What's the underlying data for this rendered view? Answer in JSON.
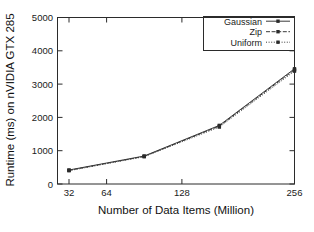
{
  "chart_data": {
    "type": "line",
    "title": "",
    "xlabel": "Number of Data Items (Million)",
    "ylabel": "Runtime (ms) on nVIDIA GTX 285",
    "x": [
      32,
      64,
      128,
      256
    ],
    "xticklabels": [
      "32",
      "64",
      "128",
      "256"
    ],
    "yticklabels": [
      "0",
      "1000",
      "2000",
      "3000",
      "4000",
      "5000"
    ],
    "yticks": [
      0,
      1000,
      2000,
      3000,
      4000,
      5000
    ],
    "ylim": [
      0,
      5000
    ],
    "xscale": "log2",
    "grid": false,
    "legend_position": "top-right",
    "series": [
      {
        "name": "Gaussian",
        "values": [
          420,
          840,
          1760,
          3460
        ],
        "style": "solid",
        "marker": "square",
        "color": "#3a3a3a"
      },
      {
        "name": "Zip",
        "values": [
          410,
          830,
          1740,
          3430
        ],
        "style": "dashed",
        "marker": "square",
        "color": "#3a3a3a"
      },
      {
        "name": "Uniform",
        "values": [
          400,
          820,
          1710,
          3390
        ],
        "style": "dotted",
        "marker": "square",
        "color": "#3a3a3a"
      }
    ]
  },
  "axes": {
    "y_label": "Runtime (ms) on nVIDIA GTX 285",
    "x_label": "Number of Data Items (Million)",
    "y_ticks": [
      "5000",
      "4000",
      "3000",
      "2000",
      "1000",
      "0"
    ],
    "x_ticks": [
      "32",
      "64",
      "128",
      "256"
    ]
  },
  "legend": {
    "entries": [
      {
        "label": "Gaussian"
      },
      {
        "label": "Zip"
      },
      {
        "label": "Uniform"
      }
    ]
  }
}
